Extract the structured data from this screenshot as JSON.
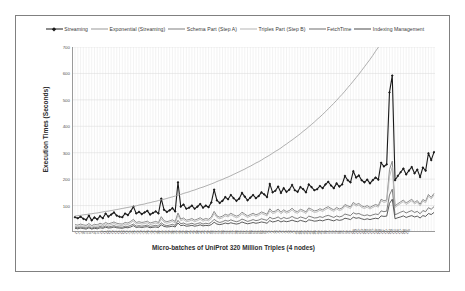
{
  "chart_data": {
    "type": "line",
    "title": "",
    "xlabel": "Micro-batches of UniProt 320 Million Triples (4 nodes)",
    "ylabel": "Execution Times (Seconds)",
    "ylim": [
      0,
      700
    ],
    "yticks": [
      0,
      100,
      200,
      300,
      400,
      500,
      600,
      700
    ],
    "ytick_labels": [
      "",
      "100",
      "200",
      "300",
      "400",
      "500",
      "600",
      "700"
    ],
    "grid": true,
    "legend_position": "top-center",
    "xtick_labels": [
      "1",
      "2",
      "3",
      "4",
      "5",
      "6",
      "7",
      "8",
      "9",
      "10",
      "11",
      "12",
      "13",
      "14",
      "15",
      "16",
      "17",
      "18",
      "19",
      "20",
      "21",
      "22",
      "23",
      "24",
      "25",
      "26",
      "27",
      "28",
      "29",
      "30",
      "31",
      "32",
      "33",
      "34",
      "35",
      "36",
      "37",
      "38",
      "39",
      "40",
      "41",
      "42",
      "43",
      "44",
      "45",
      "46",
      "47",
      "48",
      "49",
      "50",
      "51",
      "52",
      "53",
      "54",
      "55",
      "56",
      "57",
      "58",
      "59",
      "60",
      "61",
      "62",
      "63",
      "64",
      "65",
      "66",
      "67",
      "68",
      "69",
      "70",
      "71",
      "72",
      "73",
      "74",
      "75",
      "76",
      "77",
      "78",
      "79",
      "80",
      "81",
      "82",
      "83",
      "84",
      "85",
      "86",
      "87",
      "88",
      "89",
      "90",
      "91",
      "92",
      "93",
      "94",
      "95",
      "96",
      "97",
      "98",
      "99",
      "100",
      "101",
      "102",
      "103",
      "104",
      "105",
      "106",
      "107",
      "108",
      "109",
      "110",
      "111",
      "112",
      "113",
      "114",
      "115",
      "116",
      "117",
      "118",
      "119",
      "120"
    ],
    "series": [
      {
        "name": "Streaming",
        "color": "#1a1a1a",
        "marker": "diamond",
        "width": 1.1,
        "values": [
          56,
          52,
          58,
          50,
          46,
          62,
          44,
          55,
          48,
          60,
          52,
          70,
          58,
          66,
          74,
          62,
          58,
          56,
          70,
          64,
          78,
          96,
          70,
          76,
          68,
          74,
          80,
          66,
          72,
          78,
          70,
          126,
          84,
          76,
          82,
          90,
          78,
          188,
          96,
          104,
          88,
          92,
          100,
          88,
          96,
          106,
          92,
          100,
          94,
          112,
          160,
          120,
          110,
          118,
          132,
          124,
          140,
          128,
          118,
          126,
          148,
          134,
          120,
          130,
          140,
          128,
          136,
          150,
          142,
          132,
          182,
          150,
          156,
          172,
          148,
          166,
          152,
          160,
          178,
          158,
          152,
          170,
          162,
          150,
          180,
          170,
          158,
          162,
          174,
          166,
          180,
          190,
          176,
          166,
          184,
          172,
          180,
          212,
          196,
          188,
          230,
          206,
          214,
          196,
          188,
          198,
          184,
          196,
          206,
          198,
          262,
          248,
          256,
          528,
          592,
          196,
          212,
          226,
          240,
          218,
          232,
          246,
          222,
          236,
          208,
          244,
          232,
          298,
          272,
          302
        ]
      },
      {
        "name": "Exponential (Streaming)",
        "color": "#9a9a9a",
        "marker": "none",
        "width": 0.8,
        "values": [
          60,
          62,
          63,
          65,
          66,
          68,
          69,
          71,
          72,
          74,
          76,
          78,
          79,
          81,
          83,
          85,
          87,
          89,
          91,
          93,
          95,
          97,
          99,
          102,
          104,
          106,
          109,
          111,
          114,
          116,
          119,
          122,
          124,
          127,
          130,
          133,
          136,
          139,
          142,
          146,
          149,
          152,
          156,
          159,
          163,
          167,
          170,
          174,
          178,
          182,
          186,
          191,
          195,
          199,
          204,
          208,
          213,
          218,
          223,
          228,
          233,
          238,
          244,
          249,
          255,
          261,
          266,
          272,
          279,
          285,
          291,
          298,
          305,
          311,
          318,
          326,
          333,
          341,
          348,
          356,
          364,
          372,
          381,
          389,
          398,
          407,
          416,
          426,
          435,
          445,
          455,
          466,
          476,
          487,
          498,
          510,
          521,
          533,
          546,
          558,
          571,
          584,
          597,
          611,
          625,
          639,
          653,
          668,
          684,
          699,
          715,
          731,
          748,
          765,
          782,
          800,
          818,
          837,
          856,
          876
        ]
      },
      {
        "name": "Schema Part (Step A)",
        "color": "#808080",
        "marker": "none",
        "width": 0.9,
        "values": [
          28,
          26,
          30,
          27,
          25,
          32,
          24,
          29,
          27,
          33,
          29,
          36,
          31,
          34,
          38,
          33,
          31,
          30,
          36,
          34,
          40,
          48,
          36,
          39,
          36,
          38,
          41,
          34,
          37,
          40,
          36,
          58,
          43,
          39,
          42,
          46,
          40,
          72,
          49,
          53,
          45,
          47,
          51,
          45,
          49,
          54,
          47,
          51,
          48,
          57,
          78,
          61,
          56,
          60,
          67,
          63,
          71,
          65,
          60,
          64,
          75,
          68,
          61,
          66,
          71,
          65,
          69,
          76,
          72,
          67,
          88,
          76,
          79,
          87,
          75,
          84,
          77,
          81,
          90,
          80,
          77,
          86,
          82,
          76,
          91,
          86,
          80,
          82,
          88,
          84,
          91,
          96,
          89,
          84,
          93,
          87,
          91,
          104,
          99,
          95,
          112,
          104,
          108,
          99,
          95,
          100,
          93,
          99,
          104,
          100,
          124,
          118,
          121,
          236,
          268,
          99,
          107,
          114,
          121,
          110,
          117,
          124,
          112,
          119,
          105,
          123,
          117,
          142,
          131,
          146
        ]
      },
      {
        "name": "Triples Part (Step B)",
        "color": "#b5b5b5",
        "marker": "none",
        "width": 0.9,
        "values": [
          22,
          20,
          24,
          21,
          19,
          26,
          18,
          23,
          21,
          27,
          23,
          30,
          25,
          28,
          32,
          27,
          25,
          24,
          30,
          28,
          34,
          42,
          30,
          33,
          30,
          32,
          35,
          28,
          31,
          34,
          30,
          50,
          37,
          33,
          36,
          40,
          34,
          64,
          43,
          47,
          39,
          41,
          45,
          39,
          43,
          48,
          41,
          45,
          42,
          51,
          70,
          55,
          50,
          54,
          61,
          57,
          65,
          59,
          54,
          58,
          69,
          62,
          55,
          60,
          65,
          59,
          63,
          70,
          66,
          61,
          80,
          70,
          73,
          81,
          69,
          78,
          71,
          75,
          84,
          74,
          71,
          80,
          76,
          70,
          85,
          80,
          74,
          76,
          82,
          78,
          85,
          90,
          83,
          78,
          87,
          81,
          85,
          98,
          93,
          89,
          106,
          98,
          102,
          93,
          89,
          94,
          87,
          93,
          98,
          94,
          118,
          112,
          115,
          210,
          246,
          93,
          101,
          108,
          115,
          104,
          111,
          118,
          106,
          113,
          99,
          117,
          111,
          136,
          125,
          140
        ]
      },
      {
        "name": "FetchTime",
        "color": "#6e6e6e",
        "marker": "none",
        "width": 0.9,
        "values": [
          18,
          16,
          19,
          17,
          15,
          20,
          14,
          18,
          16,
          21,
          18,
          23,
          19,
          21,
          24,
          20,
          19,
          18,
          22,
          21,
          25,
          30,
          22,
          24,
          22,
          24,
          26,
          21,
          23,
          25,
          22,
          35,
          27,
          24,
          26,
          29,
          25,
          44,
          31,
          34,
          29,
          30,
          33,
          29,
          32,
          35,
          30,
          33,
          31,
          37,
          48,
          40,
          36,
          39,
          44,
          41,
          46,
          42,
          39,
          42,
          49,
          45,
          40,
          43,
          47,
          43,
          45,
          50,
          47,
          44,
          56,
          50,
          52,
          57,
          49,
          55,
          51,
          53,
          59,
          53,
          51,
          57,
          54,
          50,
          60,
          57,
          53,
          54,
          58,
          55,
          60,
          63,
          59,
          55,
          61,
          57,
          60,
          68,
          65,
          62,
          73,
          68,
          70,
          65,
          62,
          65,
          61,
          65,
          68,
          66,
          80,
          77,
          79,
          140,
          162,
          65,
          70,
          75,
          79,
          72,
          77,
          81,
          74,
          78,
          69,
          81,
          77,
          92,
          86,
          96
        ]
      },
      {
        "name": "Indexing Management",
        "color": "#4a4a4a",
        "marker": "none",
        "width": 0.9,
        "values": [
          14,
          12,
          15,
          13,
          11,
          16,
          11,
          14,
          12,
          16,
          14,
          18,
          15,
          16,
          19,
          16,
          15,
          14,
          17,
          16,
          19,
          24,
          17,
          19,
          17,
          19,
          20,
          16,
          18,
          19,
          17,
          27,
          21,
          19,
          20,
          22,
          19,
          34,
          24,
          26,
          22,
          23,
          25,
          22,
          24,
          27,
          23,
          25,
          24,
          28,
          37,
          30,
          28,
          30,
          34,
          31,
          35,
          32,
          30,
          32,
          38,
          34,
          31,
          33,
          36,
          33,
          35,
          38,
          36,
          33,
          43,
          38,
          40,
          44,
          38,
          42,
          39,
          41,
          45,
          41,
          39,
          44,
          41,
          38,
          46,
          44,
          41,
          42,
          45,
          42,
          46,
          48,
          45,
          42,
          47,
          44,
          46,
          52,
          50,
          47,
          56,
          52,
          54,
          50,
          47,
          50,
          47,
          50,
          52,
          50,
          61,
          59,
          60,
          108,
          124,
          50,
          54,
          57,
          61,
          55,
          59,
          62,
          57,
          60,
          53,
          62,
          59,
          70,
          66,
          74
        ]
      }
    ]
  },
  "legend": {
    "items": [
      {
        "label": "Streaming",
        "color": "#1a1a1a",
        "marker": "diamond"
      },
      {
        "label": "Exponential (Streaming)",
        "color": "#9a9a9a",
        "marker": "none"
      },
      {
        "label": "Schema Part (Step A)",
        "color": "#808080",
        "marker": "none"
      },
      {
        "label": "Triples Part (Step B)",
        "color": "#b5b5b5",
        "marker": "none"
      },
      {
        "label": "FetchTime",
        "color": "#6e6e6e",
        "marker": "none"
      },
      {
        "label": "Indexing Management",
        "color": "#4a4a4a",
        "marker": "none"
      }
    ]
  },
  "colors": {
    "frame_border": "#808080",
    "axis": "#9a9a9a",
    "grid_major": "#d8d8d8",
    "grid_minor": "#e6e6e6",
    "background": "#ffffff",
    "text": "#555555"
  }
}
